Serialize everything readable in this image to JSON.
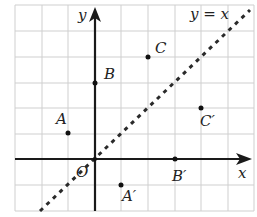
{
  "diagram": {
    "type": "coordinate-plane-reflection",
    "colors": {
      "grid": "#cfcfcf",
      "axis": "#1a1a1a",
      "points": "#111111",
      "text": "#222222"
    },
    "grid": {
      "x_range": [
        -3,
        6
      ],
      "y_range": [
        -2,
        6
      ],
      "step": 1
    },
    "axes": {
      "x_label": "x",
      "y_label": "y",
      "origin_label": "O"
    },
    "mirror_line": {
      "label": "y = x",
      "style": "dashed"
    },
    "points": [
      {
        "name": "A",
        "label": "A",
        "x": -1,
        "y": 1
      },
      {
        "name": "B",
        "label": "B",
        "x": 0,
        "y": 3
      },
      {
        "name": "C",
        "label": "C",
        "x": 2,
        "y": 4
      },
      {
        "name": "A-prime",
        "label": "A′",
        "x": 1,
        "y": -1
      },
      {
        "name": "B-prime",
        "label": "B′",
        "x": 3,
        "y": 0
      },
      {
        "name": "C-prime",
        "label": "C′",
        "x": 4,
        "y": 2
      }
    ]
  }
}
